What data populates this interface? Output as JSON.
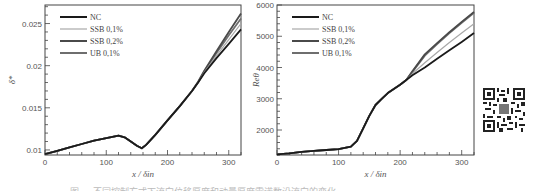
{
  "colors": {
    "NC": "#1a1a1a",
    "SSB 0,1%": "#a8a8a8",
    "SSB 0,2%": "#4a4a4a",
    "UB 0,1%": "#6e6e6e"
  },
  "legend": [
    "NC",
    "SSB 0,1%",
    "SSB 0,2%",
    "UB 0,1%"
  ],
  "chart_data": [
    {
      "type": "line",
      "title": "",
      "xlabel": "x / δin",
      "ylabel": "δ*",
      "xlim": [
        0,
        320
      ],
      "ylim": [
        0.0094,
        0.0272
      ],
      "xticks": [
        0,
        100,
        200,
        300
      ],
      "xtick_labels": [
        "0",
        "100",
        "200",
        "300"
      ],
      "yticks": [
        0.01,
        0.015,
        0.02,
        0.025
      ],
      "ytick_labels": [
        "0.01",
        "0.015",
        "0.02",
        "0.025"
      ],
      "grid": false,
      "legend_position": "upper left",
      "x": [
        0,
        20,
        40,
        60,
        80,
        100,
        120,
        130,
        140,
        150,
        158,
        165,
        180,
        200,
        220,
        240,
        250,
        260,
        280,
        300,
        320
      ],
      "series": [
        {
          "name": "NC",
          "values": [
            0.0095,
            0.0099,
            0.0103,
            0.0107,
            0.0111,
            0.0114,
            0.0117,
            0.0115,
            0.011,
            0.0105,
            0.0102,
            0.0106,
            0.0118,
            0.0135,
            0.0152,
            0.017,
            0.018,
            0.0191,
            0.0209,
            0.0226,
            0.0243
          ]
        },
        {
          "name": "SSB 0,1%",
          "values": [
            0.0095,
            0.0099,
            0.0103,
            0.0107,
            0.0111,
            0.0114,
            0.0117,
            0.0115,
            0.011,
            0.0105,
            0.0102,
            0.0106,
            0.0118,
            0.0135,
            0.0152,
            0.017,
            0.018,
            0.0192,
            0.0212,
            0.0231,
            0.025
          ]
        },
        {
          "name": "SSB 0,2%",
          "values": [
            0.0095,
            0.0099,
            0.0103,
            0.0107,
            0.0111,
            0.0114,
            0.0117,
            0.0115,
            0.011,
            0.0105,
            0.0102,
            0.0106,
            0.0118,
            0.0135,
            0.0152,
            0.017,
            0.0181,
            0.0194,
            0.0217,
            0.024,
            0.0262
          ]
        },
        {
          "name": "UB 0,1%",
          "values": [
            0.0095,
            0.0099,
            0.0103,
            0.0107,
            0.0111,
            0.0114,
            0.0117,
            0.0115,
            0.011,
            0.0105,
            0.0102,
            0.0106,
            0.0118,
            0.0135,
            0.0152,
            0.017,
            0.018,
            0.0193,
            0.0215,
            0.0236,
            0.0256
          ]
        }
      ]
    },
    {
      "type": "line",
      "title": "",
      "xlabel": "x / δin",
      "ylabel": "Reθ",
      "xlim": [
        0,
        320
      ],
      "ylim": [
        1200,
        6000
      ],
      "xticks": [
        0,
        100,
        200,
        300
      ],
      "xtick_labels": [
        "0",
        "100",
        "200",
        "300"
      ],
      "yticks": [
        2000,
        3000,
        4000,
        5000,
        6000
      ],
      "ytick_labels": [
        "2000",
        "3000",
        "4000",
        "5000",
        "6000"
      ],
      "grid": false,
      "legend_position": "upper left",
      "x": [
        0,
        20,
        40,
        60,
        80,
        100,
        120,
        130,
        140,
        150,
        160,
        170,
        180,
        200,
        210,
        220,
        240,
        260,
        280,
        300,
        320
      ],
      "series": [
        {
          "name": "NC",
          "values": [
            1220,
            1250,
            1300,
            1330,
            1360,
            1390,
            1470,
            1650,
            2050,
            2450,
            2800,
            3000,
            3180,
            3450,
            3600,
            3750,
            4000,
            4280,
            4550,
            4820,
            5100
          ]
        },
        {
          "name": "SSB 0,1%",
          "values": [
            1220,
            1250,
            1300,
            1330,
            1360,
            1390,
            1470,
            1650,
            2050,
            2450,
            2800,
            3000,
            3180,
            3450,
            3600,
            3800,
            4150,
            4480,
            4800,
            5100,
            5400
          ]
        },
        {
          "name": "SSB 0,2%",
          "values": [
            1220,
            1250,
            1300,
            1330,
            1360,
            1390,
            1470,
            1650,
            2050,
            2450,
            2800,
            3000,
            3180,
            3450,
            3600,
            3880,
            4420,
            4780,
            5130,
            5460,
            5780
          ]
        },
        {
          "name": "UB 0,1%",
          "values": [
            1220,
            1250,
            1300,
            1330,
            1360,
            1390,
            1470,
            1650,
            2050,
            2450,
            2800,
            3000,
            3180,
            3450,
            3600,
            3860,
            4380,
            4750,
            5100,
            5430,
            5750
          ]
        }
      ]
    }
  ],
  "caption": "图 ... 不同控制方式下流向位移厚度和动量厚度雷诺数沿流向的变化"
}
